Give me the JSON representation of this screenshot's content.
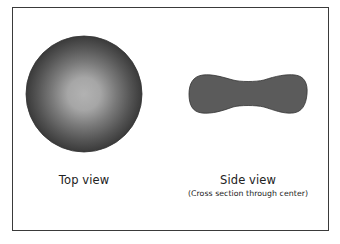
{
  "figure": {
    "top_view": {
      "label": "Top view",
      "shape": "disc-radial-gradient",
      "colors": {
        "center": "#b0b0b0",
        "edge": "#3c3c3c"
      }
    },
    "side_view": {
      "label": "Side view",
      "sublabel": "(Cross section through center)",
      "shape": "biconcave-dumbbell",
      "colors": {
        "fill": "#5a5a5a",
        "stroke": "#3a3a3a"
      }
    },
    "frame_color": "#3a3a3a"
  }
}
